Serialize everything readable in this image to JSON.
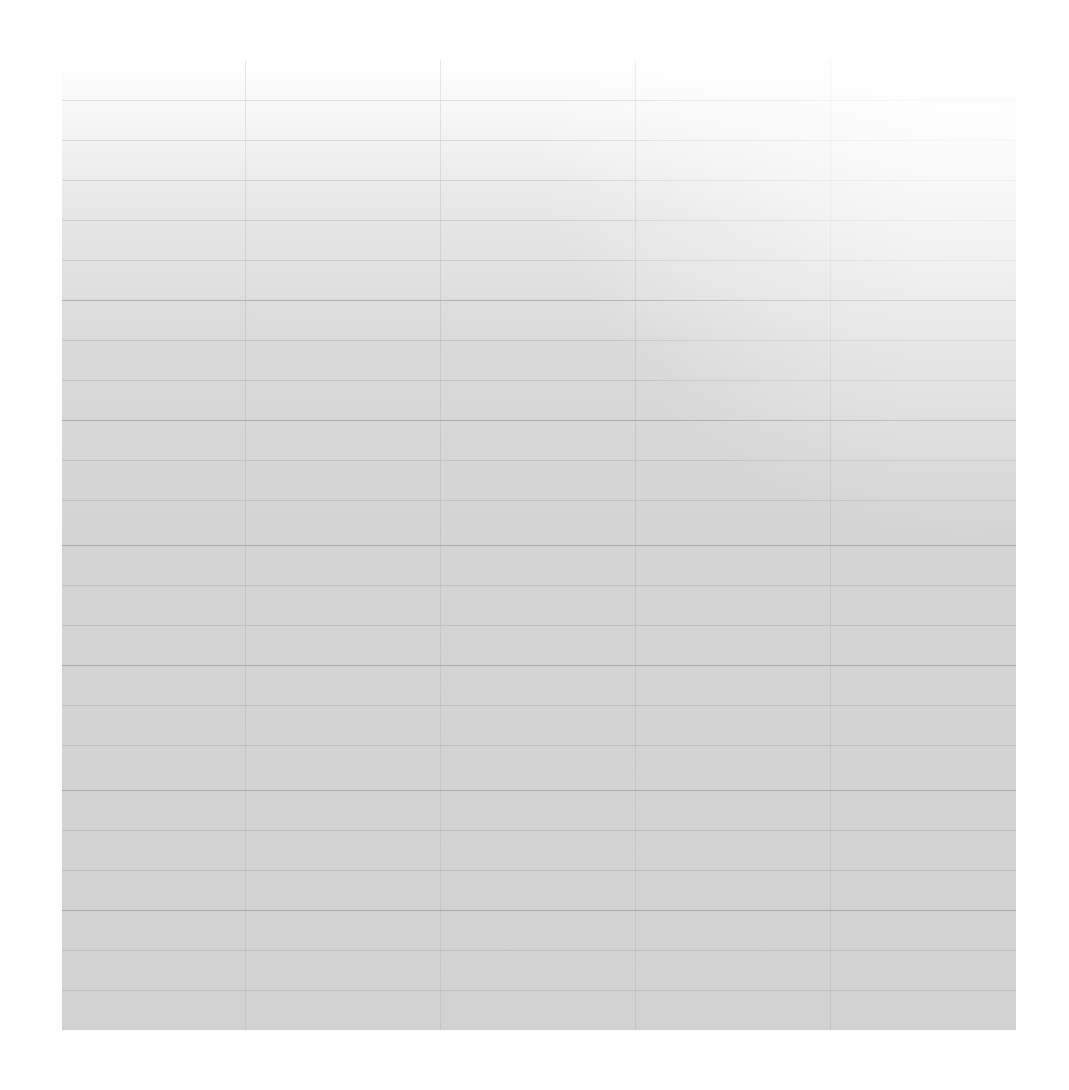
{
  "image": {
    "description": "Photograph of a blank ruled/grid paper sheet, no text",
    "sheet": {
      "left": 62,
      "top": 60,
      "width": 954,
      "height": 970
    },
    "colors": {
      "page_background": "#ffffff",
      "sheet_top": "#ffffff",
      "sheet_bottom": "#d2d2d2",
      "rule": "#8a8a8a"
    },
    "horizontal_rules_y": [
      100,
      140,
      180,
      220,
      260,
      300,
      340,
      380,
      420,
      460,
      500,
      545,
      585,
      625,
      665,
      705,
      745,
      790,
      830,
      870,
      910,
      950,
      990
    ],
    "major_rules_y": [
      300,
      420,
      545,
      665,
      790,
      910
    ],
    "vertical_rules_x": [
      245,
      440,
      635,
      830
    ]
  }
}
